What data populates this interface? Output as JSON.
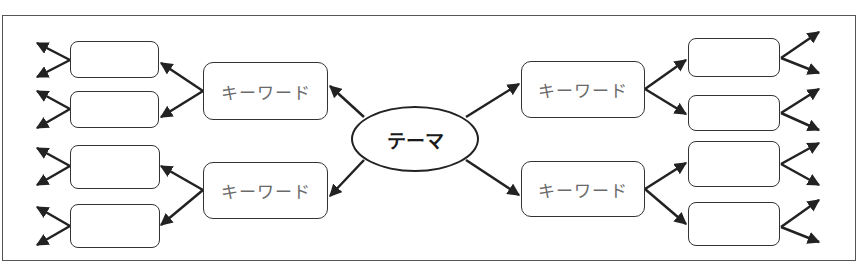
{
  "diagram": {
    "type": "mind-map",
    "center": {
      "label": "テーマ"
    },
    "keywords": [
      {
        "label": "キーワード",
        "position": "upper-left"
      },
      {
        "label": "キーワード",
        "position": "lower-left"
      },
      {
        "label": "キーワード",
        "position": "upper-right"
      },
      {
        "label": "キーワード",
        "position": "lower-right"
      }
    ],
    "sub_boxes": [
      {
        "label": "",
        "parent": "upper-left"
      },
      {
        "label": "",
        "parent": "upper-left"
      },
      {
        "label": "",
        "parent": "lower-left"
      },
      {
        "label": "",
        "parent": "lower-left"
      },
      {
        "label": "",
        "parent": "upper-right"
      },
      {
        "label": "",
        "parent": "upper-right"
      },
      {
        "label": "",
        "parent": "lower-right"
      },
      {
        "label": "",
        "parent": "lower-right"
      }
    ],
    "colors": {
      "line": "#222222",
      "keyword_text": "#6a6a6a",
      "frame": "#555555"
    }
  }
}
